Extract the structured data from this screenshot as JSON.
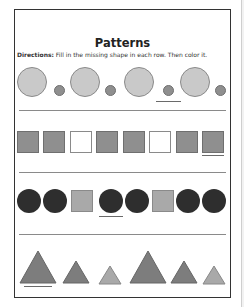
{
  "worksheet": {
    "title": "Patterns",
    "directions_label": "Directions:",
    "directions_text": " Fill in the missing shape in each row. Then color it."
  },
  "colors": {
    "light_gray": "#c9c9c9",
    "mid_gray": "#8f8f8f",
    "dark": "#2e2e2e",
    "white": "#ffffff",
    "triangle_dark": "#7d7d7d",
    "triangle_light": "#a9a9a9"
  },
  "rows": [
    {
      "name": "row-circles",
      "pattern": [
        "large-circle",
        "small-circle",
        "large-circle",
        "small-circle",
        "large-circle",
        "small-circle",
        "large-circle",
        "small-circle"
      ],
      "underlined_index": 5
    },
    {
      "name": "row-squares",
      "pattern": [
        "gray-square",
        "gray-square",
        "white-square",
        "gray-square",
        "gray-square",
        "white-square",
        "gray-square",
        "gray-square"
      ],
      "underlined_index": 7
    },
    {
      "name": "row-circles-squares",
      "pattern": [
        "dark-circle",
        "dark-circle",
        "gray-square",
        "dark-circle",
        "dark-circle",
        "gray-square",
        "dark-circle",
        "dark-circle"
      ],
      "underlined_index": 3
    },
    {
      "name": "row-triangles",
      "pattern": [
        "large-triangle",
        "medium-triangle",
        "small-triangle",
        "large-triangle",
        "medium-triangle",
        "small-triangle"
      ],
      "underlined_index": 0
    }
  ]
}
